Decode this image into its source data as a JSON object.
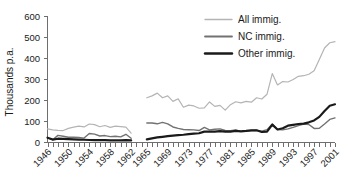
{
  "chart_data": {
    "type": "line",
    "title": "",
    "subtitle": "",
    "xlabel": "",
    "ylabel": "Thousands p.a.",
    "ylim": [
      0,
      600
    ],
    "ytick_labels": [
      "0",
      "100",
      "200",
      "300",
      "400",
      "500",
      "600"
    ],
    "ytick_values": [
      0,
      100,
      200,
      300,
      400,
      500,
      600
    ],
    "xlim": [
      1946,
      2001
    ],
    "xtick_labels": [
      "1946",
      "1950",
      "1954",
      "1958",
      "1962",
      "1965",
      "1969",
      "1973",
      "1977",
      "1981",
      "1985",
      "1989",
      "1993",
      "1997",
      "2001"
    ],
    "xtick_values": [
      1946,
      1950,
      1954,
      1958,
      1962,
      1965,
      1969,
      1973,
      1977,
      1981,
      1985,
      1989,
      1993,
      1997,
      2001
    ],
    "grid": false,
    "legend_position": "top-right",
    "legend": [
      "All immig.",
      "NC immig.",
      "Other immig."
    ],
    "colors": {
      "all_immig": "#b4b4b4",
      "nc_immig": "#727272",
      "other_immig": "#1a1a1a",
      "axis": "#6e6e6e",
      "text": "#1a1a1a",
      "background": "#ffffff"
    },
    "data_gap": [
      1963,
      1964
    ],
    "series": [
      {
        "name": "All immig.",
        "color": "#b4b4b4",
        "linewidth": 1.2,
        "x": [
          1946,
          1947,
          1948,
          1949,
          1950,
          1951,
          1952,
          1953,
          1954,
          1955,
          1956,
          1957,
          1958,
          1959,
          1960,
          1961,
          1962,
          1965,
          1966,
          1967,
          1968,
          1969,
          1970,
          1971,
          1972,
          1973,
          1974,
          1975,
          1976,
          1977,
          1978,
          1979,
          1980,
          1981,
          1982,
          1983,
          1984,
          1985,
          1986,
          1987,
          1988,
          1989,
          1990,
          1991,
          1992,
          1993,
          1994,
          1995,
          1996,
          1997,
          1998,
          1999,
          2000,
          2001
        ],
        "values": [
          65,
          60,
          58,
          57,
          67,
          73,
          78,
          74,
          88,
          85,
          75,
          81,
          72,
          78,
          76,
          73,
          45,
          213,
          222,
          235,
          213,
          222,
          196,
          208,
          168,
          178,
          174,
          163,
          165,
          193,
          172,
          177,
          154,
          180,
          194,
          189,
          196,
          192,
          213,
          207,
          230,
          328,
          274,
          290,
          288,
          300,
          315,
          318,
          325,
          342,
          395,
          450,
          475,
          480
        ]
      },
      {
        "name": "NC immig.",
        "color": "#727272",
        "linewidth": 1.4,
        "x": [
          1946,
          1947,
          1948,
          1949,
          1950,
          1951,
          1952,
          1953,
          1954,
          1955,
          1956,
          1957,
          1958,
          1959,
          1960,
          1961,
          1962,
          1965,
          1966,
          1967,
          1968,
          1969,
          1970,
          1971,
          1972,
          1973,
          1974,
          1975,
          1976,
          1977,
          1978,
          1979,
          1980,
          1981,
          1982,
          1983,
          1984,
          1985,
          1986,
          1987,
          1988,
          1989,
          1990,
          1991,
          1992,
          1993,
          1994,
          1995,
          1996,
          1997,
          1998,
          1999,
          2000,
          2001
        ],
        "values": [
          22,
          13,
          34,
          30,
          25,
          25,
          24,
          21,
          43,
          40,
          31,
          33,
          28,
          30,
          27,
          39,
          20,
          93,
          93,
          89,
          96,
          89,
          74,
          67,
          62,
          61,
          60,
          57,
          72,
          60,
          63,
          65,
          57,
          56,
          60,
          53,
          55,
          57,
          58,
          54,
          61,
          88,
          62,
          60,
          65,
          72,
          80,
          88,
          86,
          67,
          68,
          88,
          110,
          117
        ]
      },
      {
        "name": "Other immig.",
        "color": "#1a1a1a",
        "linewidth": 2.2,
        "x": [
          1946,
          1947,
          1948,
          1949,
          1950,
          1951,
          1952,
          1953,
          1954,
          1955,
          1956,
          1957,
          1958,
          1959,
          1960,
          1961,
          1962,
          1965,
          1966,
          1967,
          1968,
          1969,
          1970,
          1971,
          1972,
          1973,
          1974,
          1975,
          1976,
          1977,
          1978,
          1979,
          1980,
          1981,
          1982,
          1983,
          1984,
          1985,
          1986,
          1987,
          1988,
          1989,
          1990,
          1991,
          1992,
          1993,
          1994,
          1995,
          1996,
          1997,
          1998,
          1999,
          2000,
          2001
        ],
        "values": [
          23,
          14,
          18,
          17,
          16,
          15,
          14,
          13,
          12,
          11,
          11,
          11,
          10,
          10,
          10,
          11,
          10,
          15,
          20,
          24,
          27,
          30,
          33,
          35,
          37,
          40,
          42,
          44,
          52,
          52,
          52,
          54,
          52,
          52,
          55,
          53,
          55,
          58,
          58,
          50,
          52,
          85,
          62,
          68,
          80,
          84,
          88,
          90,
          96,
          105,
          122,
          150,
          175,
          182
        ]
      }
    ]
  }
}
